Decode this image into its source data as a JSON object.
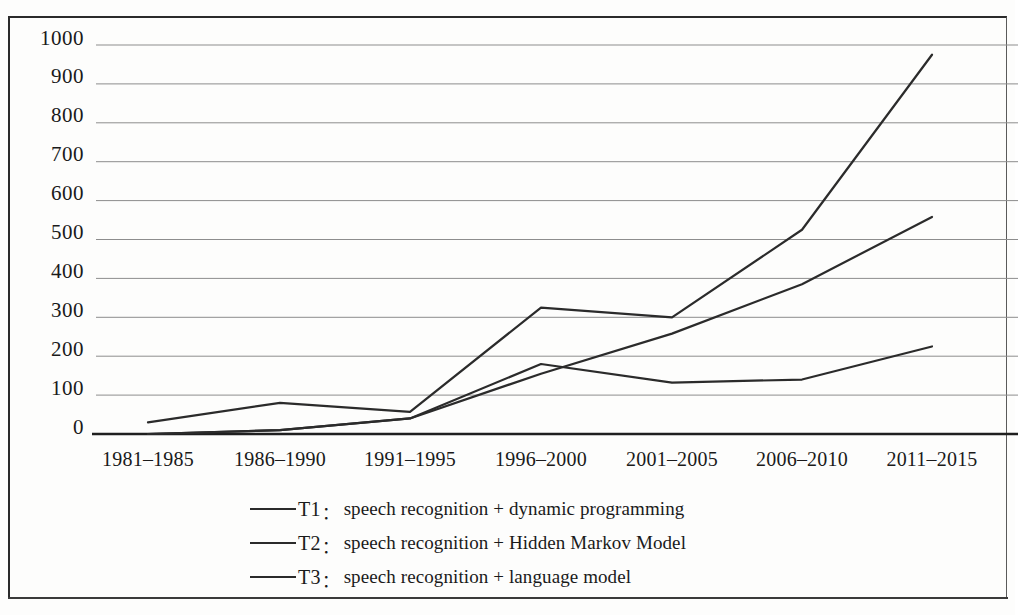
{
  "chart_data": {
    "type": "line",
    "title": "",
    "subtitle": "",
    "xlabel": "",
    "ylabel": "",
    "categories": [
      "1981–1985",
      "1986–1990",
      "1991–1995",
      "1996–2000",
      "2001–2005",
      "2006–2010",
      "2011–2015"
    ],
    "ylim": [
      0,
      1000
    ],
    "yticks": [
      0,
      100,
      200,
      300,
      400,
      500,
      600,
      700,
      800,
      900,
      1000
    ],
    "grid": true,
    "legend_position": "bottom",
    "series": [
      {
        "name": "T1",
        "key": "T1",
        "label": "speech recognition + dynamic programming",
        "color": "#2b2b2b",
        "values": [
          0,
          10,
          40,
          180,
          132,
          140,
          225
        ]
      },
      {
        "name": "T2",
        "key": "T2",
        "label": "speech recognition + Hidden Markov Model",
        "color": "#2b2b2b",
        "values": [
          30,
          80,
          57,
          325,
          300,
          525,
          975
        ]
      },
      {
        "name": "T3",
        "key": "T3",
        "label": "speech recognition + language model",
        "color": "#2b2b2b",
        "values": [
          0,
          10,
          40,
          155,
          258,
          385,
          558
        ]
      }
    ]
  },
  "axis": {
    "y_tick_labels": [
      "1000",
      "900",
      "800",
      "700",
      "600",
      "500",
      "400",
      "300",
      "200",
      "100",
      "0"
    ],
    "x_tick_labels": [
      "1981–1985",
      "1986–1990",
      "1991–1995",
      "1996–2000",
      "2001–2005",
      "2006–2010",
      "2011–2015"
    ]
  },
  "legend": {
    "separator": "：",
    "items": [
      {
        "key": "T1",
        "label": "speech recognition + dynamic programming"
      },
      {
        "key": "T2",
        "label": "speech recognition + Hidden Markov Model"
      },
      {
        "key": "T3",
        "label": "speech recognition + language model"
      }
    ]
  }
}
